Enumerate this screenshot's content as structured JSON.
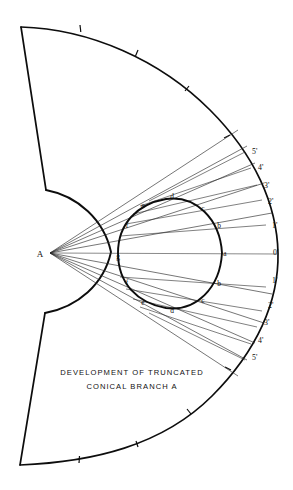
{
  "drawing": {
    "title": "Development of truncated conical branch A",
    "caption": {
      "line1": "DEVELOPMENT  OF  TRUNCATED",
      "line2": "CONICAL  BRANCH  A"
    },
    "apex": {
      "label": "A",
      "x": 50,
      "y": 253
    },
    "geometry": {
      "outer_radius": 236,
      "inner_radius": 62,
      "half_angle_deg": 72,
      "stroke_color": "#0d0d0d",
      "thin_line_color": "#2b2b2b",
      "background_color": "#ffffff"
    },
    "outer_arc_ticks": 7,
    "element_lines": [
      {
        "id": "0",
        "angle_deg": 0
      },
      {
        "id": "1-upper",
        "angle_deg": -11
      },
      {
        "id": "2-upper",
        "angle_deg": -22
      },
      {
        "id": "3-upper",
        "angle_deg": -31
      },
      {
        "id": "4-upper",
        "angle_deg": -39
      },
      {
        "id": "5-upper",
        "angle_deg": -47
      },
      {
        "id": "1-lower",
        "angle_deg": 11
      },
      {
        "id": "2-lower",
        "angle_deg": 22
      },
      {
        "id": "3-lower",
        "angle_deg": 31
      },
      {
        "id": "4-lower",
        "angle_deg": 39
      },
      {
        "id": "5-lower",
        "angle_deg": 47
      }
    ],
    "outer_labels": [
      {
        "text": "5'",
        "x": 252,
        "y": 154
      },
      {
        "text": "4'",
        "x": 258,
        "y": 170
      },
      {
        "text": "3'",
        "x": 264,
        "y": 188
      },
      {
        "text": "2'",
        "x": 268,
        "y": 204
      },
      {
        "text": "1'",
        "x": 272,
        "y": 228
      },
      {
        "text": "0'",
        "x": 273,
        "y": 255
      },
      {
        "text": "1'",
        "x": 272,
        "y": 283
      },
      {
        "text": "2'",
        "x": 268,
        "y": 308
      },
      {
        "text": "3'",
        "x": 264,
        "y": 325
      },
      {
        "text": "4'",
        "x": 258,
        "y": 343
      },
      {
        "text": "5'",
        "x": 252,
        "y": 360
      }
    ],
    "inner_curve_labels": [
      {
        "text": "g",
        "x": 118,
        "y": 259
      },
      {
        "text": "f",
        "x": 127,
        "y": 228
      },
      {
        "text": "e",
        "x": 143,
        "y": 208
      },
      {
        "text": "d",
        "x": 172,
        "y": 199
      },
      {
        "text": "c",
        "x": 203,
        "y": 211
      },
      {
        "text": "b",
        "x": 219,
        "y": 228
      },
      {
        "text": "a",
        "x": 225,
        "y": 256
      },
      {
        "text": "b",
        "x": 219,
        "y": 286
      },
      {
        "text": "c",
        "x": 203,
        "y": 303
      },
      {
        "text": "d",
        "x": 172,
        "y": 313
      },
      {
        "text": "e",
        "x": 143,
        "y": 305
      },
      {
        "text": "f",
        "x": 127,
        "y": 285
      }
    ]
  }
}
